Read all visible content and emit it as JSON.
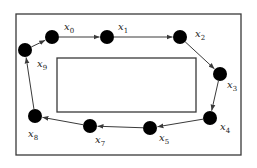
{
  "diagram": {
    "type": "closed-contour-around-obstacle",
    "colors": {
      "stroke": "#3a3a3a",
      "node": "#000000",
      "background": "#ffffff"
    },
    "outer_frame": {
      "x": 16,
      "y": 14,
      "w": 225,
      "h": 141
    },
    "inner_rect": {
      "x": 57,
      "y": 58,
      "w": 139,
      "h": 54
    },
    "nodes": [
      {
        "id": "x0",
        "base": "x",
        "sub": "0",
        "cx": 52,
        "cy": 37,
        "lx": 64,
        "ly": 30
      },
      {
        "id": "x1",
        "base": "x",
        "sub": "1",
        "cx": 107,
        "cy": 37,
        "lx": 118,
        "ly": 30
      },
      {
        "id": "x2",
        "base": "x",
        "sub": "2",
        "cx": 180,
        "cy": 37,
        "lx": 195,
        "ly": 37
      },
      {
        "id": "x3",
        "base": "x",
        "sub": "3",
        "cx": 220,
        "cy": 74,
        "lx": 227,
        "ly": 88
      },
      {
        "id": "x4",
        "base": "x",
        "sub": "4",
        "cx": 210,
        "cy": 118,
        "lx": 220,
        "ly": 130
      },
      {
        "id": "x5",
        "base": "x",
        "sub": "5",
        "cx": 150,
        "cy": 128,
        "lx": 159,
        "ly": 141
      },
      {
        "id": "x7",
        "base": "x",
        "sub": "7",
        "cx": 90,
        "cy": 126,
        "lx": 95,
        "ly": 143
      },
      {
        "id": "x8",
        "base": "x",
        "sub": "8",
        "cx": 35,
        "cy": 116,
        "lx": 28,
        "ly": 137
      },
      {
        "id": "x9",
        "base": "x",
        "sub": "9",
        "cx": 25,
        "cy": 50,
        "lx": 37,
        "ly": 67
      }
    ],
    "edges": [
      {
        "from": "x0",
        "to": "x1"
      },
      {
        "from": "x1",
        "to": "x2"
      },
      {
        "from": "x2",
        "to": "x3"
      },
      {
        "from": "x3",
        "to": "x4"
      },
      {
        "from": "x4",
        "to": "x5"
      },
      {
        "from": "x5",
        "to": "x7"
      },
      {
        "from": "x7",
        "to": "x8"
      },
      {
        "from": "x8",
        "to": "x9"
      },
      {
        "from": "x9",
        "to": "x0"
      }
    ],
    "node_radius": 7
  }
}
